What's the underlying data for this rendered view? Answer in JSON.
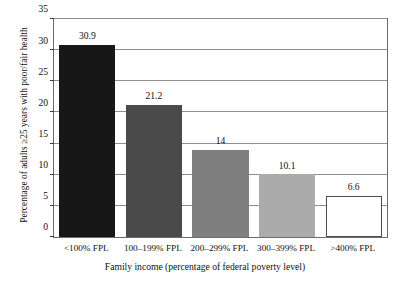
{
  "chart_data": {
    "type": "bar",
    "title": "",
    "xlabel": "Family income (percentage of federal poverty level)",
    "ylabel": "Percentage of adults ≥25 years with poor/fair health",
    "categories": [
      "<100% FPL",
      "100–199% FPL",
      "200–299% FPL",
      "300–399% FPL",
      ">400% FPL"
    ],
    "values": [
      30.9,
      21.2,
      14,
      10.1,
      6.6
    ],
    "value_labels": [
      "30.9",
      "21.2",
      "14",
      "10.1",
      "6.6"
    ],
    "ylim": [
      0,
      35
    ],
    "yticks": [
      0,
      5,
      10,
      15,
      20,
      25,
      30,
      35
    ],
    "ytick_labels": [
      "0",
      "5",
      "10",
      "15",
      "20",
      "25",
      "30",
      "35"
    ],
    "grid": true,
    "legend": "none",
    "bar_colors": [
      "#171717",
      "#4a4a4a",
      "#7f7f7f",
      "#ababab",
      "#ffffff"
    ],
    "bar_edge_colors": [
      "#171717",
      "#4a4a4a",
      "#7f7f7f",
      "#ababab",
      "#4f4f4f"
    ],
    "frame_color": "#6b6b6b",
    "grid_color": "#8e8e8e",
    "background": "#ffffff"
  }
}
